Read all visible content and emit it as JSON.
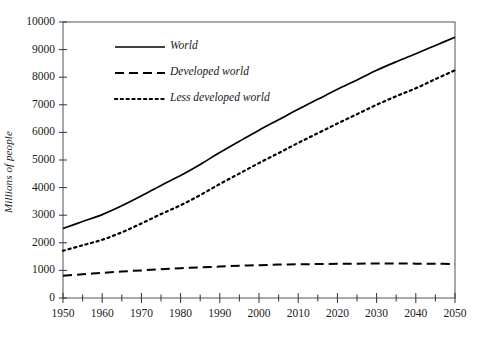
{
  "chart_data": {
    "type": "line",
    "title": "",
    "subtitle": "",
    "xlabel": "",
    "ylabel": "Millions of people",
    "xlim": [
      1950,
      2050
    ],
    "ylim": [
      0,
      10000
    ],
    "grid": false,
    "legend_position": "upper-left-inside",
    "x_tick_labels": [
      "1950",
      "1960",
      "1970",
      "1980",
      "1990",
      "2000",
      "2010",
      "2020",
      "2030",
      "2040",
      "2050"
    ],
    "x_ticks": [
      1950,
      1960,
      1970,
      1980,
      1990,
      2000,
      2010,
      2020,
      2030,
      2040,
      2050
    ],
    "x_minor_tick_step": 5,
    "y_tick_labels": [
      "0",
      "1000",
      "2000",
      "3000",
      "4000",
      "5000",
      "6000",
      "7000",
      "8000",
      "9000",
      "10000"
    ],
    "y_ticks": [
      0,
      1000,
      2000,
      3000,
      4000,
      5000,
      6000,
      7000,
      8000,
      9000,
      10000
    ],
    "x": [
      1950,
      1955,
      1960,
      1965,
      1970,
      1975,
      1980,
      1985,
      1990,
      1995,
      2000,
      2005,
      2010,
      2015,
      2020,
      2025,
      2030,
      2035,
      2040,
      2045,
      2050
    ],
    "series": [
      {
        "name": "World",
        "style": "solid",
        "color": "#000000",
        "values": [
          2520,
          2770,
          3020,
          3340,
          3700,
          4080,
          4440,
          4840,
          5270,
          5680,
          6080,
          6460,
          6840,
          7200,
          7560,
          7900,
          8250,
          8560,
          8850,
          9150,
          9450
        ]
      },
      {
        "name": "Developed world",
        "style": "dashed",
        "color": "#000000",
        "values": [
          810,
          860,
          910,
          960,
          1000,
          1040,
          1080,
          1110,
          1140,
          1170,
          1190,
          1210,
          1220,
          1230,
          1240,
          1245,
          1250,
          1250,
          1245,
          1240,
          1235
        ]
      },
      {
        "name": "Less developed world",
        "style": "dotted",
        "color": "#000000",
        "values": [
          1710,
          1910,
          2110,
          2380,
          2700,
          3040,
          3360,
          3730,
          4130,
          4510,
          4890,
          5250,
          5620,
          5970,
          6320,
          6660,
          7000,
          7310,
          7600,
          7930,
          8250
        ]
      }
    ]
  },
  "axes": {
    "frame_color": "#555555",
    "tick_color": "#333333"
  }
}
